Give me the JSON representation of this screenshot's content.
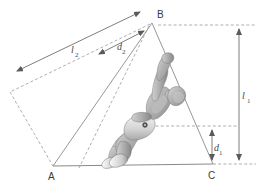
{
  "figure": {
    "background_color": "#ffffff",
    "line_color": "#8a8a8a",
    "dashed_color": "#9a9a9a",
    "dimension_color": "#6e6e6e",
    "label_color": "#3a3a3a"
  },
  "vertices": [
    {
      "id": "A",
      "label": "A",
      "x": 53,
      "y": 166
    },
    {
      "id": "B",
      "label": "B",
      "x": 152,
      "y": 22
    },
    {
      "id": "C",
      "label": "C",
      "x": 213,
      "y": 164
    }
  ],
  "dimensions": [
    {
      "id": "l1",
      "symbol": "l",
      "subscript": "1",
      "label": "l₁",
      "orientation": "vertical",
      "x": 239,
      "y_top": 25,
      "y_bottom": 164,
      "label_x": 244,
      "label_y": 98
    },
    {
      "id": "d1",
      "symbol": "d",
      "subscript": "1",
      "label": "d₁",
      "orientation": "vertical",
      "x": 212,
      "y_top": 126,
      "y_bottom": 164,
      "label_x": 216,
      "label_y": 150
    },
    {
      "id": "l2",
      "symbol": "l",
      "subscript": "2",
      "label": "l₂",
      "orientation": "diagonal",
      "x1": 142,
      "y1": 11,
      "x2": 14,
      "y2": 73,
      "label_x": 73,
      "label_y": 50
    },
    {
      "id": "d2",
      "symbol": "d",
      "subscript": "2",
      "label": "d₂",
      "orientation": "diagonal",
      "x1": 146,
      "y1": 30,
      "x2": 96,
      "y2": 55,
      "label_x": 119,
      "label_y": 48
    }
  ],
  "reference_lines": {
    "top_from_b": {
      "x1": 158,
      "y1": 25,
      "x2": 258,
      "y2": 25
    },
    "hip_level": {
      "x1": 140,
      "y1": 126,
      "x2": 238,
      "y2": 126
    },
    "ground_extension": {
      "x1": 213,
      "y1": 164,
      "x2": 258,
      "y2": 164
    }
  },
  "subject": {
    "name": "athlete-figure",
    "description": "greyscale rendering of a person in mid-jump, body angled back with one arm raised"
  }
}
